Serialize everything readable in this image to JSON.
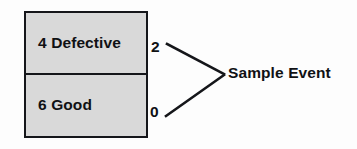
{
  "diagram": {
    "type": "sampling-tree",
    "population_box": {
      "cells": [
        {
          "count": "4",
          "category": "Defective",
          "label": "4 Defective"
        },
        {
          "count": "6",
          "category": "Good",
          "label": "6 Good"
        }
      ],
      "fill_color": "#d9d9d9",
      "border_color": "#15161a"
    },
    "outcome_counts": [
      {
        "label": "2",
        "from_cell": "4 Defective"
      },
      {
        "label": "0",
        "from_cell": "6 Good"
      }
    ],
    "result_label": "Sample Event",
    "connectors": [
      {
        "from": "2",
        "to": "Sample Event",
        "x1": 167,
        "y1": 44,
        "x2": 224,
        "y2": 74
      },
      {
        "from": "0",
        "to": "Sample Event",
        "x1": 166,
        "y1": 116,
        "x2": 224,
        "y2": 75
      }
    ]
  }
}
